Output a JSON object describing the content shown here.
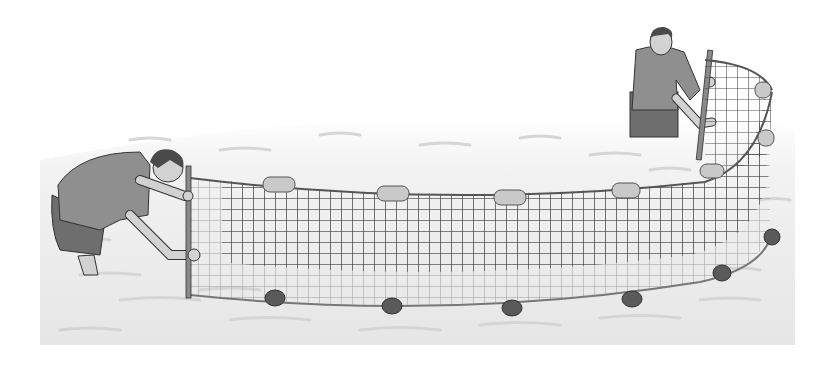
{
  "image": {
    "description": "Grayscale illustration of two men wading in water holding a seine net with floats on top and weights at the bottom",
    "caption": "Two people seining with a net in shallow water",
    "colors": {
      "background": "#ffffff",
      "water": "#ececec",
      "water_ripple": "#d0d0d0",
      "net_line": "#3a3a3a",
      "float": "#c9c9c9",
      "sinker": "#5a5a5a",
      "shirt": "#8f8f8f",
      "pants": "#6e6e6e",
      "skin": "#d2d2d2",
      "hair": "#4a4a4a",
      "pole": "#8a8a8a"
    },
    "figures": [
      {
        "name": "left-person",
        "pose": "bending forward holding pole"
      },
      {
        "name": "right-person",
        "pose": "standing holding pole"
      }
    ],
    "net": {
      "floats": 8,
      "sinkers": 7
    }
  }
}
